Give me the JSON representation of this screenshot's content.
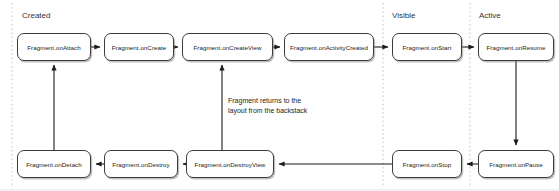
{
  "diagram": {
    "background_color": "#ffffff",
    "node_border_color": "#3c3c3c",
    "arrow_color": "#1a1a1a",
    "divider_color": "#bfbfbf",
    "phases": [
      {
        "label": "Created",
        "label_x": 22,
        "label_y": 11,
        "divider_x": 12
      },
      {
        "label": "Visible",
        "label_x": 392,
        "label_y": 11,
        "divider_x": 383
      },
      {
        "label": "Active",
        "label_x": 479,
        "label_y": 11,
        "divider_x": 470
      }
    ],
    "nodes": [
      {
        "id": "onAttach",
        "label": "Fragment.onAttach",
        "x": 17,
        "y": 33,
        "w": 74,
        "h": 28
      },
      {
        "id": "onCreate",
        "label": "Fragment.onCreate",
        "x": 104,
        "y": 33,
        "w": 70,
        "h": 28
      },
      {
        "id": "onCreateView",
        "label": "Fragment.onCreateView",
        "x": 182,
        "y": 33,
        "w": 91,
        "h": 28
      },
      {
        "id": "onActivityCreated",
        "label": "Fragment.onActivityCreated",
        "x": 284,
        "y": 33,
        "w": 90,
        "h": 28
      },
      {
        "id": "onStart",
        "label": "Fragment.onStart",
        "x": 392,
        "y": 33,
        "w": 70,
        "h": 28
      },
      {
        "id": "onResume",
        "label": "Fragment.onResume",
        "x": 478,
        "y": 33,
        "w": 76,
        "h": 28
      },
      {
        "id": "onDetach",
        "label": "Fragment.onDetach",
        "x": 17,
        "y": 150,
        "w": 74,
        "h": 28
      },
      {
        "id": "onDestroy",
        "label": "Fragment.onDestroy",
        "x": 104,
        "y": 150,
        "w": 74,
        "h": 28
      },
      {
        "id": "onDestroyView",
        "label": "Fragment.onDestroyView",
        "x": 186,
        "y": 150,
        "w": 88,
        "h": 28
      },
      {
        "id": "onStop",
        "label": "Fragment.onStop",
        "x": 392,
        "y": 150,
        "w": 70,
        "h": 28
      },
      {
        "id": "onPause",
        "label": "Fragment.onPause",
        "x": 478,
        "y": 150,
        "w": 76,
        "h": 28
      }
    ],
    "annotation": {
      "line1": "Fragment returns to the",
      "line2": "layout from the backstack",
      "x": 228,
      "y": 96
    },
    "edges": [
      {
        "from": "onAttach",
        "to": "onCreate",
        "kind": "horizontal-right"
      },
      {
        "from": "onCreate",
        "to": "onCreateView",
        "kind": "horizontal-right"
      },
      {
        "from": "onCreateView",
        "to": "onActivityCreated",
        "kind": "horizontal-right"
      },
      {
        "from": "onActivityCreated",
        "to": "onStart",
        "kind": "horizontal-right"
      },
      {
        "from": "onStart",
        "to": "onResume",
        "kind": "horizontal-right"
      },
      {
        "from": "onResume",
        "to": "onPause",
        "kind": "vertical-down"
      },
      {
        "from": "onPause",
        "to": "onStop",
        "kind": "horizontal-left"
      },
      {
        "from": "onStop",
        "to": "onDestroyView",
        "kind": "horizontal-left-long"
      },
      {
        "from": "onDestroyView",
        "to": "onDestroy",
        "kind": "horizontal-left"
      },
      {
        "from": "onDestroy",
        "to": "onDetach",
        "kind": "horizontal-left"
      },
      {
        "from": "onDetach",
        "to": "onAttach",
        "kind": "vertical-up"
      },
      {
        "from": "onDestroyView",
        "to": "onCreateView",
        "kind": "vertical-up-backstack"
      }
    ]
  }
}
